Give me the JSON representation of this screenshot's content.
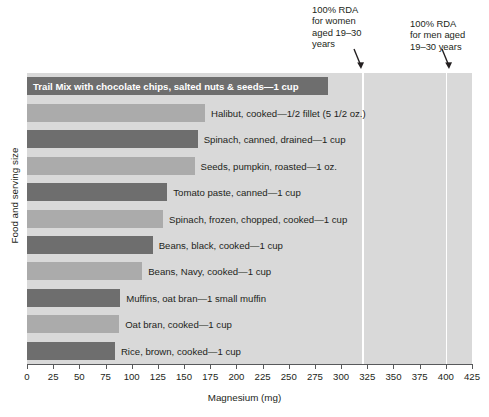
{
  "chart_data": {
    "type": "bar",
    "orientation": "horizontal",
    "title": "",
    "xlabel": "Magnesium (mg)",
    "ylabel": "Food and serving size",
    "xlim": [
      0,
      425
    ],
    "xticks": [
      0,
      25,
      50,
      75,
      100,
      125,
      150,
      175,
      200,
      225,
      250,
      275,
      300,
      325,
      350,
      375,
      400,
      425
    ],
    "grid": false,
    "categories": [
      "Trail Mix with chocolate chips, salted nuts & seeds—1 cup",
      "Halibut, cooked—1/2 fillet (5 1/2 oz.)",
      "Spinach, canned, drained—1 cup",
      "Seeds, pumpkin, roasted—1 oz.",
      "Tomato paste, canned—1 cup",
      "Spinach, frozen, chopped, cooked—1 cup",
      "Beans, black, cooked—1 cup",
      "Beans, Navy, cooked—1 cup",
      "Muffins, oat bran—1 small muffin",
      "Oat bran, cooked—1 cup",
      "Rice, brown, cooked—1 cup"
    ],
    "values": [
      287,
      170,
      163,
      160,
      134,
      130,
      120,
      110,
      89,
      88,
      84
    ],
    "bar_colors": [
      "dark",
      "light",
      "dark",
      "light",
      "dark",
      "light",
      "dark",
      "light",
      "dark",
      "light",
      "dark"
    ],
    "label_placement": [
      "inside",
      "outside",
      "outside",
      "outside",
      "outside",
      "outside",
      "outside",
      "outside",
      "outside",
      "outside",
      "outside"
    ],
    "annotations": [
      {
        "text": "100% RDA\nfor women\naged 19–30\nyears",
        "value": 320
      },
      {
        "text": "100% RDA\nfor men aged\n19–30 years",
        "value": 400
      }
    ],
    "reference_lines": [
      {
        "name": "women-rda-line",
        "value": 320,
        "color": "#ffffff"
      },
      {
        "name": "men-rda-line",
        "value": 400,
        "color": "#ffffff"
      }
    ],
    "colors": {
      "dark_bar": "#6e6e6e",
      "light_bar": "#ababab",
      "plot_background": "#d9d9d9",
      "axis": "#58595b",
      "text": "#231f20"
    }
  }
}
